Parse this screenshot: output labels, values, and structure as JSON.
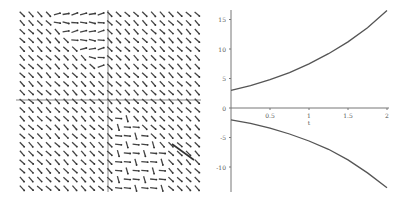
{
  "chart_data": [
    {
      "type": "vector_field",
      "title": "",
      "xlabel": "",
      "ylabel": "",
      "description": "Direction field: grid of short arrows mostly pointing down-right (slope about -1), with irregular arrows near the center-left and lower-right",
      "grid": {
        "cols": 21,
        "rows": 21
      },
      "dominant_direction": "down-right",
      "axes": {
        "x_axis_y_px": 100,
        "y_axis_x_px": 108
      }
    },
    {
      "type": "line",
      "title": "",
      "xlabel": "t",
      "ylabel": "",
      "xlim": [
        0,
        2
      ],
      "ylim": [
        -14,
        16.5
      ],
      "x_ticks": [
        "0.5",
        "1",
        "1.5",
        "2"
      ],
      "y_ticks": [
        "15",
        "10",
        "5",
        "0",
        "-5",
        "-10"
      ],
      "grid": false,
      "series": [
        {
          "name": "upper solution",
          "x": [
            0,
            0.25,
            0.5,
            0.75,
            1,
            1.25,
            1.5,
            1.75,
            2
          ],
          "values": [
            3.0,
            3.8,
            4.8,
            6.0,
            7.5,
            9.2,
            11.2,
            13.6,
            16.5
          ],
          "color": "#555555"
        },
        {
          "name": "lower solution",
          "x": [
            0,
            0.25,
            0.5,
            0.75,
            1,
            1.25,
            1.5,
            1.75,
            2
          ],
          "values": [
            -2.0,
            -2.6,
            -3.4,
            -4.4,
            -5.6,
            -7.0,
            -8.8,
            -11.0,
            -13.5
          ],
          "color": "#555555"
        }
      ]
    }
  ]
}
